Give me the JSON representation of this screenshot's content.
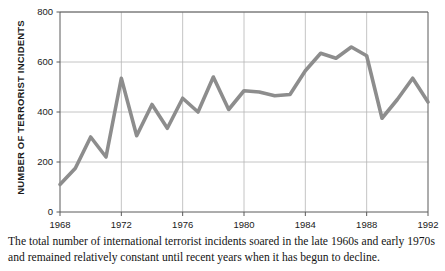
{
  "chart_data": {
    "type": "line",
    "title": "",
    "xlabel": "",
    "ylabel": "NUMBER OF TERRORIST INCIDENTS",
    "xlim": [
      1968,
      1992
    ],
    "ylim": [
      0,
      800
    ],
    "grid": true,
    "legend": "none",
    "line_color": "#8d8d8d",
    "axis_color": "#5a5a5a",
    "grid_color": "#b5b5b5",
    "y_ticks": [
      "0",
      "200",
      "400",
      "600",
      "800"
    ],
    "y_tick_values": [
      0,
      200,
      400,
      600,
      800
    ],
    "x_ticks": [
      "1968",
      "1972",
      "1976",
      "1980",
      "1984",
      "1988",
      "1992"
    ],
    "x_tick_values": [
      1968,
      1972,
      1976,
      1980,
      1984,
      1988,
      1992
    ],
    "x": [
      1968,
      1969,
      1970,
      1971,
      1972,
      1973,
      1974,
      1975,
      1976,
      1977,
      1978,
      1979,
      1980,
      1981,
      1982,
      1983,
      1984,
      1985,
      1986,
      1987,
      1988,
      1989,
      1990,
      1991,
      1992
    ],
    "values": [
      110,
      175,
      300,
      220,
      535,
      305,
      430,
      335,
      455,
      400,
      540,
      410,
      485,
      480,
      465,
      470,
      565,
      635,
      615,
      660,
      625,
      375,
      450,
      535,
      440
    ],
    "series": [
      {
        "name": "Number of terrorist incidents",
        "values": [
          110,
          175,
          300,
          220,
          535,
          305,
          430,
          335,
          455,
          400,
          540,
          410,
          485,
          480,
          465,
          470,
          565,
          635,
          615,
          660,
          625,
          375,
          450,
          535,
          440
        ]
      }
    ]
  },
  "caption": {
    "text": "The total number of international terrorist incidents soared in the late 1960s and early 1970s and remained relatively constant until recent years when it has begun to decline."
  }
}
